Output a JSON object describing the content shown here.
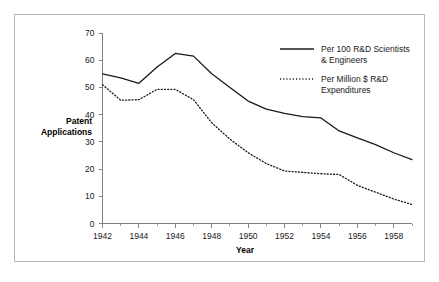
{
  "chart_data": {
    "type": "line",
    "title": "",
    "subtitle": "",
    "xlabel": "Year",
    "ylabel": "Patent Applications",
    "xlim": [
      1942,
      1959
    ],
    "ylim": [
      0,
      70
    ],
    "grid": false,
    "legend_position": "top-right",
    "x": [
      1942,
      1943,
      1944,
      1945,
      1946,
      1947,
      1948,
      1949,
      1950,
      1951,
      1952,
      1953,
      1954,
      1955,
      1956,
      1957,
      1958,
      1959
    ],
    "y_ticks": [
      0,
      10,
      20,
      30,
      40,
      50,
      60,
      70
    ],
    "y_tick_labels": [
      "0",
      "10",
      "20",
      "30",
      "40",
      "50",
      "60",
      "70"
    ],
    "x_ticks": [
      1942,
      1944,
      1946,
      1948,
      1950,
      1952,
      1954,
      1956,
      1958
    ],
    "x_tick_labels": [
      "1942",
      "1944",
      "1946",
      "1948",
      "1950",
      "1952",
      "1954",
      "1956",
      "1958"
    ],
    "x_minor_ticks": [
      1943,
      1945,
      1947,
      1949,
      1951,
      1953,
      1955,
      1957,
      1959
    ],
    "series": [
      {
        "name": "Per 100 R&D Scientists & Engineers",
        "style": "solid",
        "color": "#1a1a1a",
        "values": [
          55.0,
          53.5,
          51.5,
          57.5,
          62.5,
          61.5,
          55.0,
          50.0,
          45.0,
          42.0,
          40.5,
          39.3,
          38.8,
          34.0,
          31.5,
          29.0,
          26.0,
          23.5
        ]
      },
      {
        "name": "Per Million $ R&D Expenditures",
        "style": "dotted",
        "color": "#1a1a1a",
        "values": [
          51.0,
          45.3,
          45.5,
          49.3,
          49.3,
          45.5,
          37.0,
          31.0,
          26.0,
          22.0,
          19.3,
          18.8,
          18.3,
          18.0,
          14.0,
          11.5,
          9.0,
          7.0
        ]
      }
    ]
  },
  "axes": {
    "y_axis_title": "Patent Applications",
    "y_axis_title_line1": "Patent",
    "y_axis_title_line2": "Applications",
    "x_axis_title": "Year"
  },
  "legend": {
    "entries": [
      {
        "line1": "Per 100 R&D Scientists",
        "line2": "& Engineers",
        "style": "solid"
      },
      {
        "line1": "Per Million $ R&D",
        "line2": "Expenditures",
        "style": "dotted"
      }
    ]
  },
  "colors": {
    "frame_border": "#b8b8b8",
    "axis": "#808080",
    "text": "#1a1a1a",
    "series": "#1a1a1a",
    "background": "#ffffff"
  }
}
